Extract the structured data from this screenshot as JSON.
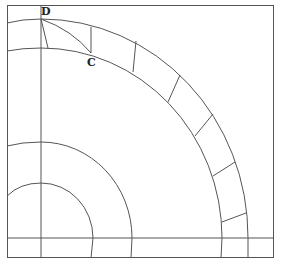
{
  "figure": {
    "type": "geometric-construction",
    "labels": [
      {
        "id": "D",
        "text": "D",
        "x": 41,
        "y": 15
      },
      {
        "id": "C",
        "text": "C",
        "x": 87,
        "y": 66
      }
    ],
    "points": {
      "D": [
        41,
        19
      ],
      "C": [
        91,
        53
      ]
    },
    "center": [
      41,
      238
    ],
    "frame": {
      "x": 7,
      "y": 5,
      "width": 267,
      "height": 253
    },
    "axes": {
      "vertical_x": 41,
      "horizontal_y": 238
    },
    "arcs": [
      {
        "name": "small-arc",
        "rx": 52,
        "ry": 55
      },
      {
        "name": "mid-arc",
        "rx": 91,
        "ry": 96
      },
      {
        "name": "band-inner-arc",
        "rx": 181,
        "ry": 190
      },
      {
        "name": "band-outer-arc",
        "rx": 207,
        "ry": 218
      }
    ],
    "band_dividers": [
      [
        [
          41,
          19
        ],
        [
          48,
          48
        ]
      ],
      [
        [
          91,
          27
        ],
        [
          91,
          53
        ]
      ],
      [
        [
          136,
          41
        ],
        [
          133,
          72
        ]
      ],
      [
        [
          180,
          75
        ],
        [
          168,
          102
        ]
      ],
      [
        [
          213,
          114
        ],
        [
          195,
          136
        ]
      ],
      [
        [
          235,
          162
        ],
        [
          213,
          176
        ]
      ],
      [
        [
          246,
          213
        ],
        [
          222,
          222
        ]
      ]
    ],
    "colors": {
      "line": "#555555",
      "label": "#222222",
      "background": "#ffffff"
    }
  }
}
